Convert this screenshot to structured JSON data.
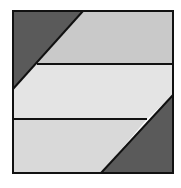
{
  "diagram": {
    "type": "geometric-square-dissection",
    "square": {
      "x": 13,
      "y": 11,
      "size": 160
    },
    "colors": {
      "background": "#ffffff",
      "dark_triangle": "#5a5a5a",
      "top_band": "#c9c9c9",
      "middle_band": "#e4e4e4",
      "bottom_band": "#d9d9d9",
      "stroke": "#111111"
    },
    "regions": [
      {
        "name": "top-left-triangle",
        "points": "13,11 83,11 13,89",
        "fill": "dark_triangle"
      },
      {
        "name": "top-band",
        "points": "83,11 173,11 173,64 37,64",
        "fill": "top_band"
      },
      {
        "name": "middle-band",
        "points": "37,64 173,64 173,95 147,119 13,119 13,89",
        "fill": "middle_band"
      },
      {
        "name": "bottom-band",
        "points": "13,119 147,119 101,173 13,173",
        "fill": "bottom_band"
      },
      {
        "name": "bottom-right-triangle",
        "points": "173,95 173,173 101,173",
        "fill": "dark_triangle"
      }
    ],
    "lines": [
      {
        "name": "top-diagonal",
        "x1": 83,
        "y1": 11,
        "x2": 13,
        "y2": 89
      },
      {
        "name": "upper-horizontal",
        "x1": 37,
        "y1": 64,
        "x2": 173,
        "y2": 64
      },
      {
        "name": "lower-horizontal",
        "x1": 13,
        "y1": 119,
        "x2": 147,
        "y2": 119
      },
      {
        "name": "bottom-diagonal",
        "x1": 173,
        "y1": 95,
        "x2": 101,
        "y2": 173
      }
    ]
  }
}
